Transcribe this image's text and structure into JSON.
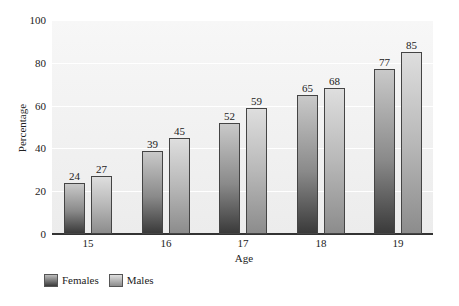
{
  "chart_data": {
    "type": "bar",
    "title": "",
    "xlabel": "Age",
    "ylabel": "Percentage",
    "categories": [
      "15",
      "16",
      "17",
      "18",
      "19"
    ],
    "series": [
      {
        "name": "Females",
        "values": [
          24,
          39,
          52,
          65,
          77
        ]
      },
      {
        "name": "Males",
        "values": [
          27,
          45,
          59,
          68,
          85
        ]
      }
    ],
    "ylim": [
      0,
      100
    ],
    "yticks": [
      "0",
      "20",
      "40",
      "60",
      "80",
      "100"
    ],
    "grid": true,
    "legend_position": "bottom-left",
    "data_labels": true
  },
  "colors": {
    "female_bar_dark": "#3a3a3a",
    "male_bar": "#b8b8b8",
    "plot_background": "#efefef"
  }
}
